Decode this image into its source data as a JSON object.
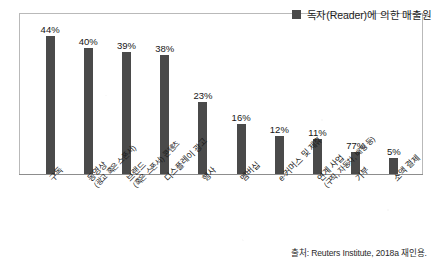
{
  "legend": {
    "label": "독자(Reader)에 의한 매출원",
    "swatch_color": "#4a4a4a",
    "swatch_icon": "square-swatch-icon"
  },
  "source": {
    "text": "출처: Reuters Institute, 2018a 재인용."
  },
  "chart_data": {
    "type": "bar",
    "title": "",
    "subtitle": "",
    "xlabel": "",
    "ylabel": "",
    "ylim": [
      0,
      50
    ],
    "grid": false,
    "legend_position": "top-right",
    "series_name": "독자(Reader)에 의한 매출원",
    "bar_color": "#4a4a4a",
    "categories": [
      "구독",
      "동영상",
      "브랜드",
      "디스플레이 광고",
      "행사",
      "멤버십",
      "e-커머스 및 제휴",
      "연계 사업",
      "기부",
      "소액 결제"
    ],
    "category_sublabels": [
      "",
      "(광고 혹은 스폰서)",
      "(혹은 스폰서) 콘텐츠",
      "",
      "",
      "",
      "",
      "(구직, 자동차, 배팅 등)",
      "",
      ""
    ],
    "values": [
      44,
      40,
      39,
      38,
      23,
      16,
      12,
      11,
      7,
      5
    ],
    "value_labels": [
      "44%",
      "40%",
      "39%",
      "38%",
      "23%",
      "16%",
      "12%",
      "11%",
      "77%",
      "5%"
    ]
  }
}
